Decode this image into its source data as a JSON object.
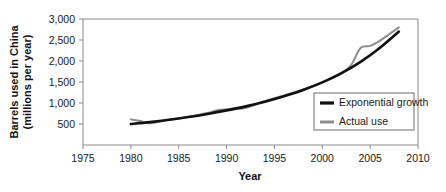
{
  "chart_data": {
    "type": "line",
    "title": "",
    "xlabel": "Year",
    "ylabel": "Barrels used in China (millions per year)",
    "ylabel_line1": "Barrels used in China",
    "ylabel_line2": "(millions per year)",
    "xlim": [
      1975,
      2010
    ],
    "ylim": [
      0,
      3000
    ],
    "xticks": [
      1975,
      1980,
      1985,
      1990,
      1995,
      2000,
      2005,
      2010
    ],
    "xtick_labels": [
      "1975",
      "1980",
      "1985",
      "1990",
      "1995",
      "2000",
      "2005",
      "2010"
    ],
    "yticks": [
      500,
      1000,
      1500,
      2000,
      2500,
      3000
    ],
    "ytick_labels": [
      "500",
      "1,000",
      "1,500",
      "2,000",
      "2,500",
      "3,000"
    ],
    "grid": false,
    "legend_position": "center-right",
    "series": [
      {
        "name": "Exponential growth",
        "color": "#111111",
        "x": [
          1980,
          1982,
          1984,
          1986,
          1988,
          1990,
          1992,
          1994,
          1996,
          1998,
          2000,
          2002,
          2004,
          2006,
          2008
        ],
        "values": [
          500,
          545,
          600,
          665,
          740,
          825,
          920,
          1030,
          1160,
          1310,
          1490,
          1710,
          1980,
          2310,
          2700
        ]
      },
      {
        "name": "Actual use",
        "color": "#8e8e8e",
        "x": [
          1980,
          1981,
          1982,
          1984,
          1986,
          1988,
          1989,
          1990,
          1991,
          1992,
          1993,
          1994,
          1996,
          1998,
          2000,
          2002,
          2003,
          2004,
          2005,
          2006,
          2007,
          2008
        ],
        "values": [
          610,
          570,
          520,
          600,
          670,
          760,
          830,
          850,
          855,
          880,
          960,
          1050,
          1180,
          1320,
          1490,
          1700,
          1900,
          2310,
          2360,
          2480,
          2640,
          2800
        ]
      }
    ]
  },
  "legend": {
    "items": [
      {
        "label": "Exponential growth",
        "color": "#111111"
      },
      {
        "label": "Actual use",
        "color": "#8e8e8e"
      }
    ]
  }
}
